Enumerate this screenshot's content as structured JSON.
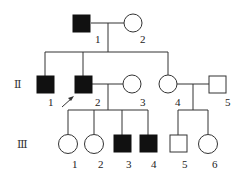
{
  "generations": [
    {
      "label": "Ⅰ",
      "members": [
        {
          "id": "1",
          "sex": "male",
          "affected": true
        },
        {
          "id": "2",
          "sex": "female",
          "affected": false
        }
      ]
    },
    {
      "label": "Ⅱ",
      "members": [
        {
          "id": "1",
          "sex": "male",
          "affected": true
        },
        {
          "id": "2",
          "sex": "male",
          "affected": true,
          "proband": true
        },
        {
          "id": "3",
          "sex": "female",
          "affected": false
        },
        {
          "id": "4",
          "sex": "female",
          "affected": false
        },
        {
          "id": "5",
          "sex": "male",
          "affected": false
        }
      ]
    },
    {
      "label": "Ⅲ",
      "members": [
        {
          "id": "1",
          "sex": "female",
          "affected": false
        },
        {
          "id": "2",
          "sex": "female",
          "affected": false
        },
        {
          "id": "3",
          "sex": "male",
          "affected": true
        },
        {
          "id": "4",
          "sex": "male",
          "affected": true
        },
        {
          "id": "5",
          "sex": "male",
          "affected": false
        },
        {
          "id": "6",
          "sex": "female",
          "affected": false
        }
      ]
    }
  ],
  "gen_labels": {
    "g2": "Ⅱ",
    "g3": "Ⅲ"
  },
  "labels": {
    "I1": "1",
    "I2": "2",
    "II1": "1",
    "II2": "2",
    "II3": "3",
    "II4": "4",
    "II5": "5",
    "III1": "1",
    "III2": "2",
    "III3": "3",
    "III4": "4",
    "III5": "5",
    "III6": "6"
  },
  "colors": {
    "affected": "#111111",
    "line": "#333333",
    "unaffected": "#ffffff"
  }
}
